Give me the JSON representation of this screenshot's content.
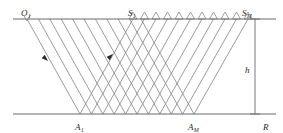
{
  "figure": {
    "type": "seismic-raypath-diagram",
    "width": 283,
    "height": 133,
    "background_color": "#ffffff",
    "line_color": "#7a7a7a",
    "axis_color": "#6b6b6b",
    "label_color": "#262626"
  },
  "labels": {
    "origin": {
      "main": "O",
      "sub": "1"
    },
    "source_first": {
      "main": "S",
      "sub": "1"
    },
    "source_last": {
      "main": "S",
      "sub": "M"
    },
    "reflection_first": {
      "main": "A",
      "sub": "1"
    },
    "reflection_last": {
      "main": "A",
      "sub": "M"
    },
    "depth": {
      "main": "h",
      "sub": ""
    },
    "reflector": {
      "main": "R",
      "sub": ""
    }
  },
  "geometry": {
    "surface_line": {
      "x1": 13,
      "y1": 19,
      "x2": 276,
      "y2": 19
    },
    "reflector_line": {
      "x1": 13,
      "y1": 114,
      "x2": 276,
      "y2": 114
    },
    "depth_line": {
      "x1": 255,
      "y1": 19,
      "x2": 255,
      "y2": 114
    },
    "depth_tick_top": {
      "x1": 250,
      "y1": 19,
      "x2": 260,
      "y2": 19
    },
    "depth_tick_bottom": {
      "x1": 250,
      "y1": 114,
      "x2": 260,
      "y2": 114
    },
    "origin_point": {
      "x": 27,
      "y": 19
    },
    "first_source": {
      "x": 133,
      "y": 19
    },
    "last_source": {
      "x": 248,
      "y": 19
    },
    "first_reflection": {
      "x": 80,
      "y": 114
    },
    "last_reflection": {
      "x": 194,
      "y": 114
    },
    "down_ray_count": 11,
    "up_ray_count": 11,
    "receiver_count": 11,
    "down_ray_top_start": 27,
    "down_ray_top_step": 11.4,
    "down_ray_bottom_start": 80,
    "down_ray_bottom_step": 11.4,
    "up_ray_bottom_start": 80,
    "up_ray_bottom_step": 11.4,
    "up_ray_top_start": 133,
    "up_ray_top_step": 11.5
  },
  "arrows": [
    {
      "name": "downgoing-ray-arrow",
      "x": 45,
      "y": 58,
      "direction": "down-right"
    },
    {
      "name": "upgoing-ray-arrow",
      "x": 110,
      "y": 57,
      "direction": "up-right"
    }
  ],
  "receivers": {
    "symbol": "triangle",
    "count": 11,
    "start_x": 133,
    "step": 11.5,
    "width": 8,
    "height": 7,
    "baseline_y": 19
  }
}
